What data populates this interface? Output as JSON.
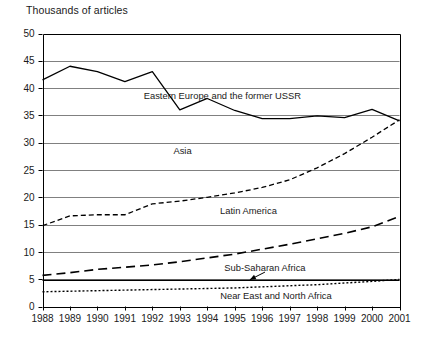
{
  "chart_data": {
    "type": "line",
    "title": "Thousands of articles",
    "subtitle": "",
    "xlabel": "",
    "ylabel": "Thousands of articles",
    "x": [
      1988,
      1989,
      1990,
      1991,
      1992,
      1993,
      1994,
      1995,
      1996,
      1997,
      1998,
      1999,
      2000,
      2001
    ],
    "xtick_labels": [
      "1988",
      "1989",
      "1990",
      "1991",
      "1992",
      "1993",
      "1994",
      "1995",
      "1996",
      "1997",
      "1998",
      "1999",
      "2000",
      "2001"
    ],
    "ytick_labels": [
      "0",
      "5",
      "10",
      "15",
      "20",
      "25",
      "30",
      "35",
      "40",
      "45",
      "50"
    ],
    "yticks": [
      0,
      5,
      10,
      15,
      20,
      25,
      30,
      35,
      40,
      45,
      50
    ],
    "ylim": [
      0,
      50
    ],
    "xlim": [
      1988,
      2001
    ],
    "grid": "horizontal",
    "legend_position": "inline-annotations",
    "series": [
      {
        "name": "Eastern Europe and the former USSR",
        "style": "solid",
        "label_x": 1994.55,
        "label_y": 38.6,
        "values": [
          41.5,
          44.0,
          43.0,
          41.2,
          43.0,
          36.0,
          38.1,
          35.9,
          34.4,
          34.4,
          34.9,
          34.6,
          36.1,
          34.0
        ]
      },
      {
        "name": "Asia",
        "style": "dashed",
        "label_x": 1993.1,
        "label_y": 28.5,
        "values": [
          14.8,
          16.6,
          16.8,
          16.8,
          18.8,
          19.3,
          20.0,
          20.8,
          21.8,
          23.2,
          25.4,
          28.0,
          31.0,
          34.2
        ]
      },
      {
        "name": "Latin America",
        "style": "long-dash",
        "label_x": 1995.5,
        "label_y": 17.6,
        "values": [
          5.7,
          6.2,
          6.8,
          7.2,
          7.6,
          8.2,
          8.9,
          9.6,
          10.5,
          11.4,
          12.4,
          13.4,
          14.6,
          16.5
        ]
      },
      {
        "name": "Sub-Saharan Africa",
        "style": "solid-thin",
        "label_x": 1996.1,
        "label_y": 7.1,
        "arrow_from_x": 1996.1,
        "arrow_from_y": 6.3,
        "arrow_to_x": 1995.55,
        "arrow_to_y": 4.9,
        "values": [
          4.8,
          4.8,
          4.8,
          4.8,
          4.8,
          4.8,
          4.8,
          4.8,
          4.8,
          4.8,
          4.8,
          4.8,
          4.8,
          4.8
        ]
      },
      {
        "name": "Near East and North Africa",
        "style": "dotted",
        "label_x": 1996.5,
        "label_y": 2.0,
        "values": [
          2.7,
          2.8,
          2.9,
          3.0,
          3.1,
          3.2,
          3.3,
          3.4,
          3.6,
          3.8,
          4.0,
          4.3,
          4.6,
          4.95
        ]
      }
    ]
  },
  "colors": {
    "line": "#000000",
    "grid": "#808080",
    "axis": "#000000",
    "text": "#1a1a1a",
    "background": "#ffffff"
  }
}
